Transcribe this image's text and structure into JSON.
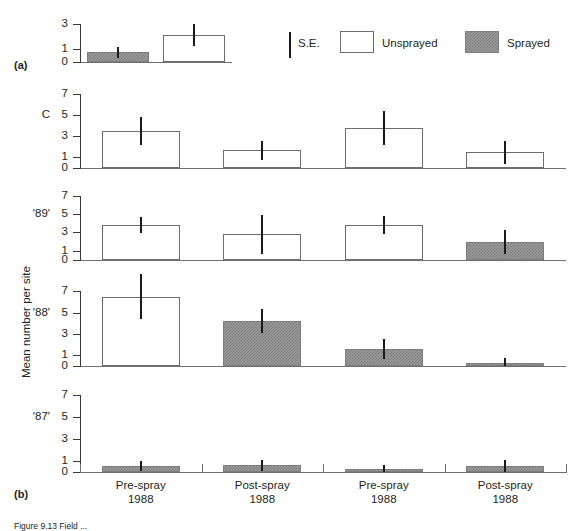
{
  "figure": {
    "panel_a_label": "(a)",
    "panel_b_label": "(b)",
    "y_axis_title": "Mean number per site",
    "caption": "Figure 9.13  Field ..."
  },
  "legend": {
    "se_label": "S.E.",
    "unsprayed_label": "Unsprayed",
    "sprayed_label": "Sprayed"
  },
  "x_categories": [
    {
      "line1": "Pre-spray",
      "line2": "1988"
    },
    {
      "line1": "Post-spray",
      "line2": "1988"
    },
    {
      "line1": "Pre-spray",
      "line2": "1988"
    },
    {
      "line1": "Post-spray",
      "line2": "1988"
    }
  ],
  "chart_data": {
    "type": "bar",
    "title": "",
    "xlabel": "",
    "ylabel": "Mean number per site",
    "grid": false,
    "legend_position": "top-right",
    "panels": [
      {
        "id": "a",
        "panel_label": "(a)",
        "row_label": "",
        "ylim": [
          0,
          3.6
        ],
        "yticks": [
          0,
          1,
          3
        ],
        "ytick_labels": [
          "0",
          "1",
          "3"
        ],
        "categories": [
          "S",
          "U"
        ],
        "bars": [
          {
            "category": "S",
            "value": 0.75,
            "se": 0.45,
            "fill": "sprayed"
          },
          {
            "category": "U",
            "value": 2.1,
            "se": 0.85,
            "fill": "unsprayed"
          }
        ]
      },
      {
        "id": "C",
        "panel_label": "",
        "row_label": "C",
        "ylim": [
          0,
          7.6
        ],
        "yticks": [
          0,
          1,
          3,
          5,
          7
        ],
        "ytick_labels": [
          "0",
          "1",
          "3",
          "5",
          "7"
        ],
        "categories": [
          "Pre-spray 1988",
          "Post-spray 1988",
          "Pre-spray 1988",
          "Post-spray 1988"
        ],
        "bars": [
          {
            "category": "Pre-spray 1988",
            "value": 3.5,
            "se": 1.3,
            "fill": "unsprayed"
          },
          {
            "category": "Post-spray 1988",
            "value": 1.7,
            "se": 0.9,
            "fill": "unsprayed"
          },
          {
            "category": "Pre-spray 1988",
            "value": 3.8,
            "se": 1.6,
            "fill": "unsprayed"
          },
          {
            "category": "Post-spray 1988",
            "value": 1.5,
            "se": 1.1,
            "fill": "unsprayed"
          }
        ]
      },
      {
        "id": "89",
        "panel_label": "",
        "row_label": "'89'",
        "ylim": [
          0,
          7.6
        ],
        "yticks": [
          0,
          1,
          3,
          5,
          7
        ],
        "ytick_labels": [
          "0",
          "1",
          "3",
          "5",
          "7"
        ],
        "categories": [
          "Pre-spray 1988",
          "Post-spray 1988",
          "Pre-spray 1988",
          "Post-spray 1988"
        ],
        "bars": [
          {
            "category": "Pre-spray 1988",
            "value": 3.8,
            "se": 0.9,
            "fill": "unsprayed"
          },
          {
            "category": "Post-spray 1988",
            "value": 2.8,
            "se": 2.1,
            "fill": "unsprayed"
          },
          {
            "category": "Pre-spray 1988",
            "value": 3.8,
            "se": 1.0,
            "fill": "unsprayed"
          },
          {
            "category": "Post-spray 1988",
            "value": 2.0,
            "se": 1.3,
            "fill": "sprayed"
          }
        ]
      },
      {
        "id": "88",
        "panel_label": "",
        "row_label": "'88'",
        "ylim": [
          0,
          8.8
        ],
        "yticks": [
          0,
          1,
          3,
          5,
          7
        ],
        "ytick_labels": [
          "0",
          "1",
          "3",
          "5",
          "7"
        ],
        "categories": [
          "Pre-spray 1988",
          "Post-spray 1988",
          "Pre-spray 1988",
          "Post-spray 1988"
        ],
        "bars": [
          {
            "category": "Pre-spray 1988",
            "value": 6.5,
            "se": 2.1,
            "fill": "unsprayed"
          },
          {
            "category": "Post-spray 1988",
            "value": 4.2,
            "se": 1.1,
            "fill": "sprayed"
          },
          {
            "category": "Pre-spray 1988",
            "value": 1.6,
            "se": 0.9,
            "fill": "sprayed"
          },
          {
            "category": "Post-spray 1988",
            "value": 0.3,
            "se": 0.45,
            "fill": "sprayed"
          }
        ]
      },
      {
        "id": "87",
        "panel_label": "(b)",
        "row_label": "'87'",
        "ylim": [
          0,
          7.6
        ],
        "yticks": [
          0,
          1,
          3,
          5,
          7
        ],
        "ytick_labels": [
          "0",
          "1",
          "3",
          "5",
          "7"
        ],
        "categories": [
          "Pre-spray 1988",
          "Post-spray 1988",
          "Pre-spray 1988",
          "Post-spray 1988"
        ],
        "bars": [
          {
            "category": "Pre-spray 1988",
            "value": 0.55,
            "se": 0.45,
            "fill": "sprayed"
          },
          {
            "category": "Post-spray 1988",
            "value": 0.6,
            "se": 0.5,
            "fill": "sprayed"
          },
          {
            "category": "Pre-spray 1988",
            "value": 0.3,
            "se": 0.3,
            "fill": "sprayed"
          },
          {
            "category": "Post-spray 1988",
            "value": 0.55,
            "se": 0.55,
            "fill": "sprayed"
          }
        ]
      }
    ]
  }
}
